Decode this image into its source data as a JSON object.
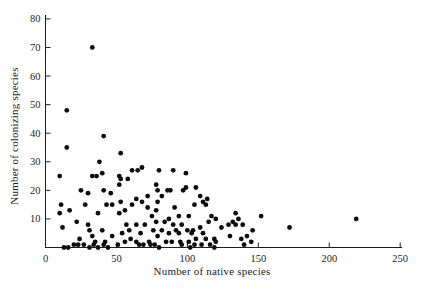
{
  "figure": {
    "background_color": "#ffffff",
    "ink_color": "#1d1d1d"
  },
  "chart_data": {
    "type": "scatter",
    "title": "",
    "xlabel": "Number of native species",
    "ylabel": "Number of colonizing species",
    "xlim": [
      0,
      250
    ],
    "ylim": [
      0,
      80
    ],
    "x_ticks": [
      0,
      50,
      100,
      150,
      200,
      250
    ],
    "y_ticks": [
      10,
      20,
      30,
      40,
      50,
      60,
      70,
      80
    ],
    "grid": false,
    "legend": null,
    "marker": {
      "shape": "circle",
      "color": "#0d0d0d",
      "radius_px": 2.4
    },
    "points": [
      [
        33,
        70
      ],
      [
        15,
        48
      ],
      [
        41,
        39
      ],
      [
        15,
        35
      ],
      [
        53,
        33
      ],
      [
        38,
        30
      ],
      [
        10,
        25
      ],
      [
        33,
        25
      ],
      [
        36,
        25
      ],
      [
        40,
        26
      ],
      [
        52,
        25
      ],
      [
        53,
        24
      ],
      [
        58,
        24
      ],
      [
        61,
        27
      ],
      [
        65,
        27
      ],
      [
        68,
        28
      ],
      [
        80,
        27
      ],
      [
        90,
        27
      ],
      [
        99,
        26
      ],
      [
        25,
        20
      ],
      [
        30,
        19
      ],
      [
        41,
        20
      ],
      [
        46,
        19
      ],
      [
        52,
        22
      ],
      [
        72,
        18
      ],
      [
        78,
        22
      ],
      [
        79,
        20
      ],
      [
        82,
        18
      ],
      [
        86,
        20
      ],
      [
        88,
        20
      ],
      [
        97,
        20
      ],
      [
        99,
        21
      ],
      [
        106,
        21
      ],
      [
        109,
        18
      ],
      [
        114,
        17
      ],
      [
        10,
        12
      ],
      [
        11,
        15
      ],
      [
        17,
        13
      ],
      [
        28,
        15
      ],
      [
        37,
        12
      ],
      [
        43,
        15
      ],
      [
        47,
        15
      ],
      [
        52,
        12
      ],
      [
        53,
        16
      ],
      [
        56,
        13
      ],
      [
        61,
        15
      ],
      [
        64,
        17
      ],
      [
        68,
        16
      ],
      [
        72,
        14
      ],
      [
        75,
        11
      ],
      [
        78,
        13
      ],
      [
        79,
        16
      ],
      [
        87,
        10
      ],
      [
        91,
        14
      ],
      [
        94,
        11
      ],
      [
        101,
        11
      ],
      [
        105,
        15
      ],
      [
        111,
        16
      ],
      [
        113,
        15
      ],
      [
        117,
        11
      ],
      [
        120,
        10
      ],
      [
        134,
        12
      ],
      [
        136,
        10
      ],
      [
        152,
        11
      ],
      [
        219,
        10
      ],
      [
        12,
        7
      ],
      [
        22,
        9
      ],
      [
        30,
        8
      ],
      [
        31,
        6
      ],
      [
        40,
        6
      ],
      [
        54,
        5
      ],
      [
        57,
        8
      ],
      [
        59,
        6
      ],
      [
        64,
        8
      ],
      [
        67,
        5
      ],
      [
        70,
        8
      ],
      [
        76,
        6
      ],
      [
        78,
        9
      ],
      [
        82,
        6
      ],
      [
        84,
        9
      ],
      [
        87,
        5
      ],
      [
        90,
        8
      ],
      [
        92,
        6
      ],
      [
        94,
        5
      ],
      [
        96,
        8
      ],
      [
        100,
        6
      ],
      [
        103,
        5
      ],
      [
        104,
        6
      ],
      [
        109,
        7
      ],
      [
        111,
        5
      ],
      [
        115,
        9
      ],
      [
        124,
        7
      ],
      [
        129,
        8
      ],
      [
        132,
        9
      ],
      [
        134,
        8
      ],
      [
        139,
        8
      ],
      [
        146,
        6
      ],
      [
        172,
        7
      ],
      [
        24,
        3
      ],
      [
        33,
        4
      ],
      [
        47,
        4
      ],
      [
        60,
        3
      ],
      [
        79,
        4
      ],
      [
        106,
        3
      ],
      [
        113,
        3
      ],
      [
        119,
        3
      ],
      [
        130,
        4
      ],
      [
        138,
        3
      ],
      [
        142,
        4
      ],
      [
        35,
        2
      ],
      [
        42,
        2
      ],
      [
        56,
        2
      ],
      [
        64,
        2
      ],
      [
        73,
        2
      ],
      [
        85,
        2
      ],
      [
        89,
        2
      ],
      [
        95,
        2
      ],
      [
        101,
        2
      ],
      [
        120,
        2
      ],
      [
        145,
        2
      ],
      [
        20,
        1
      ],
      [
        23,
        1
      ],
      [
        27,
        1
      ],
      [
        34,
        1
      ],
      [
        41,
        1
      ],
      [
        51,
        1
      ],
      [
        66,
        1
      ],
      [
        69,
        1
      ],
      [
        74,
        1
      ],
      [
        77,
        1
      ],
      [
        96,
        1
      ],
      [
        105,
        1
      ],
      [
        110,
        1
      ],
      [
        116,
        1
      ],
      [
        140,
        1
      ],
      [
        13,
        0
      ],
      [
        16,
        0
      ],
      [
        31,
        0
      ],
      [
        37,
        0
      ],
      [
        44,
        0
      ],
      [
        80,
        0
      ],
      [
        102,
        0
      ],
      [
        119,
        0
      ]
    ]
  }
}
